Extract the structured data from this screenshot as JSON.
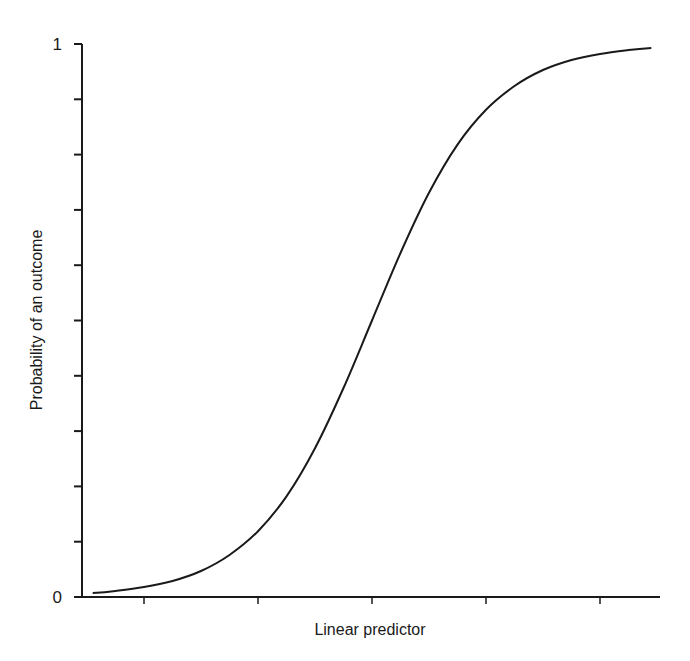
{
  "chart_data": {
    "type": "line",
    "title": "",
    "xlabel": "Linear predictor",
    "ylabel": "Probability of an outcome",
    "xlim": [
      -5,
      5
    ],
    "ylim": [
      0,
      1
    ],
    "x_ticks": [
      -4,
      -2,
      0,
      2,
      4
    ],
    "x_tick_labels": [
      "",
      "",
      "",
      "",
      ""
    ],
    "y_ticks": [
      0,
      0.1,
      0.2,
      0.3,
      0.4,
      0.5,
      0.6,
      0.7,
      0.8,
      0.9,
      1
    ],
    "y_tick_labels": [
      "0",
      "",
      "",
      "",
      "",
      "",
      "",
      "",
      "",
      "",
      "1"
    ],
    "grid": false,
    "legend": null,
    "series": [
      {
        "name": "logistic",
        "x": [
          -4.9,
          -4.5,
          -4,
          -3.5,
          -3,
          -2.5,
          -2,
          -1.5,
          -1,
          -0.5,
          0,
          0.5,
          1,
          1.5,
          2,
          2.5,
          3,
          3.5,
          4,
          4.5,
          4.9
        ],
        "values": [
          0.007,
          0.011,
          0.018,
          0.029,
          0.047,
          0.076,
          0.119,
          0.182,
          0.269,
          0.378,
          0.5,
          0.622,
          0.731,
          0.818,
          0.881,
          0.924,
          0.953,
          0.971,
          0.982,
          0.989,
          0.993
        ]
      }
    ],
    "color": "#1a1a1a"
  }
}
